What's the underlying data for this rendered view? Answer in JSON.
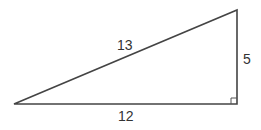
{
  "diagram": {
    "type": "right-triangle",
    "stroke_color": "#444444",
    "vertices": {
      "left": {
        "x": 14,
        "y": 104
      },
      "top_right": {
        "x": 237,
        "y": 10
      },
      "bottom_right": {
        "x": 237,
        "y": 104
      }
    },
    "sides": {
      "hypotenuse": {
        "label": "13"
      },
      "base": {
        "label": "12"
      },
      "height": {
        "label": "5"
      }
    },
    "right_angle_marker": {
      "corner": "bottom_right",
      "size": 6
    }
  }
}
